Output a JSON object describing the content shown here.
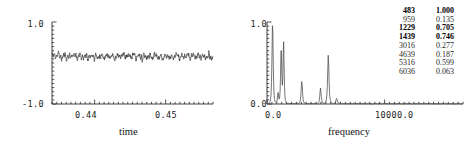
{
  "chart_data": [
    {
      "type": "line",
      "id": "time-series",
      "title": "",
      "xlabel": "time",
      "ylabel": "",
      "xlim": [
        0.4345,
        0.4555
      ],
      "ylim": [
        -1.0,
        1.0
      ],
      "grid": false,
      "legend": "none",
      "y_tick_labels": [
        "1.0",
        "-1.0"
      ],
      "y_ticks": [
        1.0,
        -1.0
      ],
      "x_tick_labels": [
        "0.44",
        "0.45"
      ],
      "x_ticks": [
        0.44,
        0.45
      ],
      "description": "Noisy quasi-periodic acoustic waveform oscillating about a small positive mean, amplitude roughly +/-0.2",
      "series": [
        {
          "name": "signal",
          "color": "#3a3a3a",
          "mean": 0.16,
          "noise_amplitude": 0.19,
          "n_points": 620
        }
      ]
    },
    {
      "type": "line",
      "id": "frequency-spectrum",
      "title": "",
      "xlabel": "frequency",
      "ylabel": "",
      "xlim": [
        0,
        17000
      ],
      "ylim": [
        0.0,
        1.0
      ],
      "grid": false,
      "legend": "none",
      "y_tick_labels": [
        "1.0",
        "0.0"
      ],
      "y_ticks": [
        1.0,
        0.0
      ],
      "x_tick_labels": [
        "0.0",
        "10000.0"
      ],
      "x_ticks": [
        0,
        10000
      ],
      "description": "Magnitude spectrum with sharp harmonic peaks; tallest peak normalised to 1.000 at 483 Hz",
      "series": [
        {
          "name": "magnitude",
          "color": "#4a4a4a",
          "peaks": [
            {
              "frequency": 483,
              "amplitude": 1.0,
              "width": 95
            },
            {
              "frequency": 959,
              "amplitude": 0.135,
              "width": 80
            },
            {
              "frequency": 1229,
              "amplitude": 0.705,
              "width": 85
            },
            {
              "frequency": 1439,
              "amplitude": 0.746,
              "width": 85
            },
            {
              "frequency": 3016,
              "amplitude": 0.277,
              "width": 105
            },
            {
              "frequency": 4639,
              "amplitude": 0.187,
              "width": 105
            },
            {
              "frequency": 5316,
              "amplitude": 0.599,
              "width": 105
            },
            {
              "frequency": 6036,
              "amplitude": 0.063,
              "width": 120
            }
          ]
        }
      ]
    }
  ],
  "time_plot": {
    "y_top_label": "1.0",
    "y_bottom_label": "-1.0",
    "x_tick_1": "0.44",
    "x_tick_2": "0.45",
    "axis_label": "time"
  },
  "frequency_plot": {
    "y_top_label": "1.0",
    "y_bottom_label": "0.0",
    "x_tick_1": "0.0",
    "x_tick_2": "10000.0",
    "axis_label": "frequency"
  },
  "peak_table": {
    "rows": [
      {
        "frequency": "483",
        "amplitude": "1.000",
        "highlighted": true
      },
      {
        "frequency": "959",
        "amplitude": "0.135",
        "highlighted": false
      },
      {
        "frequency": "1229",
        "amplitude": "0.705",
        "highlighted": true
      },
      {
        "frequency": "1439",
        "amplitude": "0.746",
        "highlighted": true
      },
      {
        "frequency": "3016",
        "amplitude": "0.277",
        "highlighted": false
      },
      {
        "frequency": "4639",
        "amplitude": "0.187",
        "highlighted": false
      },
      {
        "frequency": "5316",
        "amplitude": "0.599",
        "highlighted": false
      },
      {
        "frequency": "6036",
        "amplitude": "0.063",
        "highlighted": false
      }
    ]
  },
  "colors": {
    "trace": "#3a3a3a",
    "axis": "#2b2b2b",
    "text": "#111111",
    "background": "#ffffff"
  }
}
